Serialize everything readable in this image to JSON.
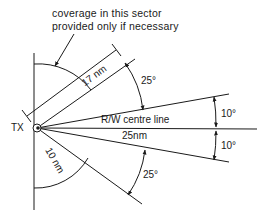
{
  "diagram": {
    "type": "coverage-sector",
    "stroke_color": "#1a1a1a",
    "background": "#ffffff",
    "transmitter": {
      "label": "TX"
    },
    "note": {
      "line1": "coverage in this sector",
      "line2": "provided only if necessary"
    },
    "dimensions": {
      "upper_radius": "17 nm",
      "lower_radius": "10 nm",
      "centre_range": "25nm"
    },
    "centre_line_label": "R/W centre line",
    "angles": {
      "upper_outer": "25°",
      "upper_inner": "10°",
      "lower_inner": "10°",
      "lower_outer": "25°"
    }
  }
}
